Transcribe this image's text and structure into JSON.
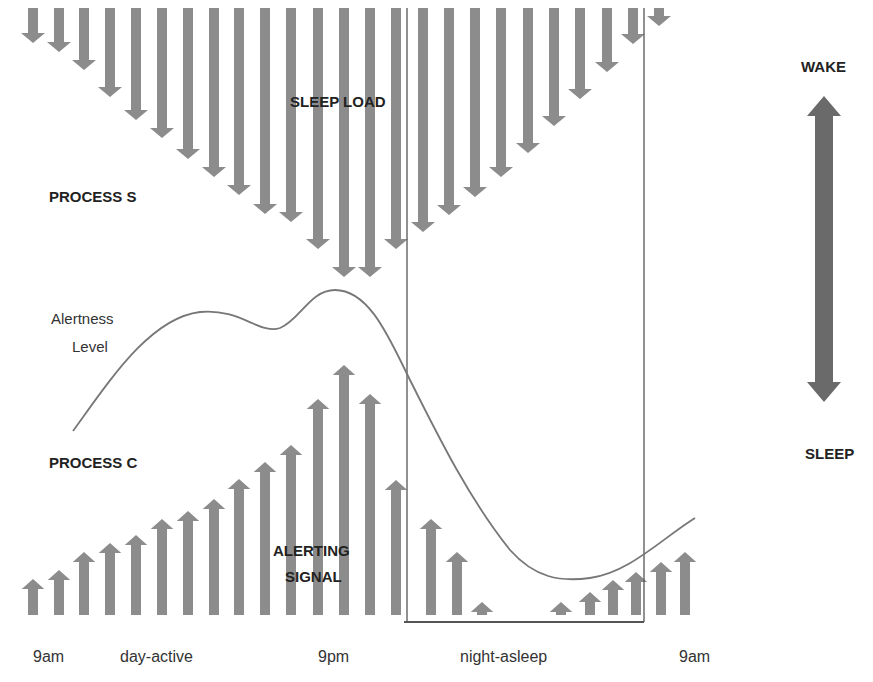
{
  "labels": {
    "sleep_load": "SLEEP LOAD",
    "process_s": "PROCESS S",
    "alertness_line1": "Alertness",
    "alertness_line2": "Level",
    "process_c": "PROCESS C",
    "alerting_line1": "ALERTING",
    "alerting_line2": "SIGNAL",
    "wake": "WAKE",
    "sleep": "SLEEP"
  },
  "time_axis": {
    "start": "9am",
    "day_period": "day-active",
    "mid": "9pm",
    "night_period": "night-asleep",
    "end": "9am"
  },
  "colors": {
    "arrow": "#8c8c8c",
    "scale_arrow": "#6a6a6a",
    "curve": "#777777",
    "box": "#555555",
    "text": "#222222"
  },
  "chart_data": {
    "type": "diagram",
    "process_s_sleep_load": {
      "direction": "down",
      "top_y": 8,
      "arrows": [
        {
          "x": 33,
          "tip": 43
        },
        {
          "x": 59,
          "tip": 52
        },
        {
          "x": 84,
          "tip": 70
        },
        {
          "x": 110,
          "tip": 97
        },
        {
          "x": 136,
          "tip": 120
        },
        {
          "x": 162,
          "tip": 138
        },
        {
          "x": 188,
          "tip": 159
        },
        {
          "x": 214,
          "tip": 177
        },
        {
          "x": 239,
          "tip": 195
        },
        {
          "x": 265,
          "tip": 214
        },
        {
          "x": 291,
          "tip": 222
        },
        {
          "x": 318,
          "tip": 249
        },
        {
          "x": 344,
          "tip": 277
        },
        {
          "x": 370,
          "tip": 277
        },
        {
          "x": 396,
          "tip": 249
        },
        {
          "x": 423,
          "tip": 232
        },
        {
          "x": 449,
          "tip": 215
        },
        {
          "x": 475,
          "tip": 197
        },
        {
          "x": 501,
          "tip": 177
        },
        {
          "x": 528,
          "tip": 153
        },
        {
          "x": 554,
          "tip": 126
        },
        {
          "x": 580,
          "tip": 99
        },
        {
          "x": 607,
          "tip": 72
        },
        {
          "x": 633,
          "tip": 44
        },
        {
          "x": 659,
          "tip": 26
        }
      ]
    },
    "process_c_alerting_signal": {
      "direction": "up",
      "base_y": 615,
      "arrows": [
        {
          "x": 33,
          "tip": 579
        },
        {
          "x": 59,
          "tip": 570
        },
        {
          "x": 84,
          "tip": 552
        },
        {
          "x": 110,
          "tip": 543
        },
        {
          "x": 136,
          "tip": 535
        },
        {
          "x": 162,
          "tip": 519
        },
        {
          "x": 188,
          "tip": 511
        },
        {
          "x": 214,
          "tip": 499
        },
        {
          "x": 239,
          "tip": 479
        },
        {
          "x": 265,
          "tip": 462
        },
        {
          "x": 291,
          "tip": 445
        },
        {
          "x": 318,
          "tip": 399
        },
        {
          "x": 344,
          "tip": 365
        },
        {
          "x": 370,
          "tip": 394
        },
        {
          "x": 396,
          "tip": 480
        },
        {
          "x": 431,
          "tip": 519
        },
        {
          "x": 457,
          "tip": 552
        },
        {
          "x": 482,
          "tip": 602
        },
        {
          "x": 561,
          "tip": 602
        },
        {
          "x": 590,
          "tip": 592
        },
        {
          "x": 613,
          "tip": 580
        },
        {
          "x": 636,
          "tip": 572
        },
        {
          "x": 661,
          "tip": 562
        },
        {
          "x": 685,
          "tip": 552
        }
      ]
    },
    "alertness_curve": "M73,431 C110,380 150,318 200,312 C240,308 260,335 280,328 C300,320 310,290 335,290 C370,290 390,340 410,380 C440,440 470,500 510,550 C535,578 560,582 590,578 C630,572 660,540 695,518",
    "night_box": {
      "x1": 407,
      "x2": 644,
      "y_top": 8,
      "y_bottom": 622
    },
    "scale": {
      "top_label": "WAKE",
      "bottom_label": "SLEEP",
      "x": 824,
      "y_top": 96,
      "y_bottom": 402
    }
  }
}
